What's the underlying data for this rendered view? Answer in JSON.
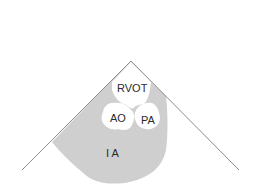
{
  "diagram": {
    "type": "echocardiography-sector-schematic",
    "view": "parasternal short axis",
    "colors": {
      "background": "#ffffff",
      "sector_line": "#8c8c8c",
      "tissue_fill": "#cfcfcf",
      "chamber_fill": "#ffffff",
      "label_text": "#2b2b2b"
    },
    "labels": {
      "rvot": "RVOT",
      "ao": "AO",
      "pa": "PA",
      "la": "I A"
    }
  }
}
